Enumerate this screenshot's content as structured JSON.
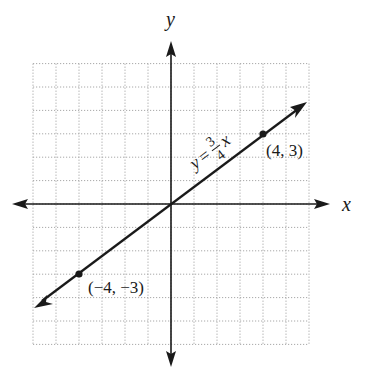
{
  "chart_data": {
    "type": "line",
    "title": "",
    "xlabel": "x",
    "ylabel": "y",
    "xlim": [
      -6,
      6
    ],
    "ylim": [
      -6,
      6
    ],
    "grid": true,
    "grid_style": "dotted",
    "grid_step": 1,
    "series": [
      {
        "name": "y = 3/4 x",
        "equation": "y = (3/4)x",
        "slope": 0.75,
        "intercept": 0,
        "x": [
          -6,
          6
        ],
        "y": [
          -4.5,
          4.5
        ]
      }
    ],
    "points": [
      {
        "x": 4,
        "y": 3,
        "label": "(4, 3)"
      },
      {
        "x": -4,
        "y": -3,
        "label": "(−4, −3)"
      }
    ],
    "annotations": [
      {
        "text": "y = 3/4 x",
        "position": "along line, upper right of origin"
      }
    ]
  },
  "labels": {
    "x_axis": "x",
    "y_axis": "y",
    "eq_y": "y",
    "eq_equals": "=",
    "eq_num": "3",
    "eq_den": "4",
    "eq_x": "x",
    "point_a": "(4, 3)",
    "point_b": "(−4, −3)"
  },
  "colors": {
    "axis": "#1a1a1a",
    "line": "#1a1a1a",
    "grid": "#a8a8a8",
    "background": "#ffffff"
  }
}
